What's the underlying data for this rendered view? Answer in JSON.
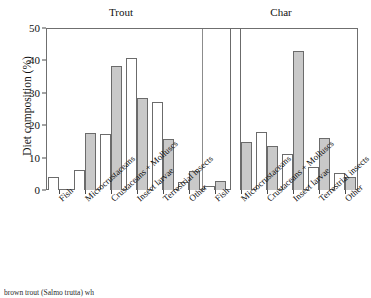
{
  "chart_data": {
    "type": "bar",
    "title": "",
    "xlabel": "",
    "ylabel": "Diet composition (%)",
    "ylim": [
      0,
      50
    ],
    "yticks": [
      0,
      10,
      20,
      30,
      40,
      50
    ],
    "grid": false,
    "legend": "none",
    "panels": [
      {
        "name": "Trout",
        "categories": [
          "Fish",
          "Microcrustaceans",
          "Crustaceans + Molluscs",
          "Insect larvae",
          "Terrestrial insects",
          "Other"
        ],
        "series": [
          {
            "name": "white",
            "values": [
              4.1,
              6.3,
              17.3,
              40.6,
              27.1,
              2.6
            ]
          },
          {
            "name": "gray",
            "values": [
              0.0,
              17.5,
              38.4,
              28.4,
              15.8,
              5.8
            ]
          }
        ]
      },
      {
        "name": "Char",
        "categories": [
          "Fish",
          "Microcrustaceans",
          "Crustaceans + Molluscs",
          "Insect larvae",
          "Terrestrial insects",
          "Other"
        ],
        "series": [
          {
            "name": "white",
            "values": [
              1.3,
              50.0,
              17.9,
              11.0,
              7.0,
              5.4
            ]
          },
          {
            "name": "gray",
            "values": [
              2.8,
              14.8,
              13.5,
              42.8,
              15.9,
              4.0
            ]
          }
        ]
      }
    ],
    "colors": {
      "white_bar": "#ffffff",
      "gray_bar": "#c9c9c9",
      "bar_outline": "#6b6b6b",
      "axis": "#6f6f6f"
    }
  },
  "titles": {
    "trout": "Trout",
    "char": "Char"
  },
  "axis": {
    "y_label": "Diet composition (%)",
    "tick_0": "0",
    "tick_10": "10",
    "tick_20": "20",
    "tick_30": "30",
    "tick_40": "40",
    "tick_50": "50"
  },
  "x_labels": {
    "t0": "Fish",
    "t1": "Microcrustaceans",
    "t2": "Crustaceans + Molluscs",
    "t3": "Insect larvae",
    "t4": "Terrestrial insects",
    "t5": "Other",
    "c0": "Fish",
    "c1": "Microcrustaceans",
    "c2": "Crustaceans + Molluscs",
    "c3": "Insect larvae",
    "c4": "Terrestrial insects",
    "c5": "Other"
  },
  "caption": {
    "text": "brown trout (Salmo trutta) wh"
  }
}
